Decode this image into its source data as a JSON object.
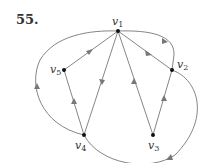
{
  "problem": {
    "number": "55."
  },
  "graph": {
    "type": "directed",
    "colors": {
      "edge": "#777777",
      "node": "#111111",
      "text": "#333333"
    },
    "vertices": [
      {
        "id": "v1",
        "label": "v",
        "sub": "1"
      },
      {
        "id": "v2",
        "label": "v",
        "sub": "2"
      },
      {
        "id": "v3",
        "label": "v",
        "sub": "3"
      },
      {
        "id": "v4",
        "label": "v",
        "sub": "4"
      },
      {
        "id": "v5",
        "label": "v",
        "sub": "5"
      }
    ],
    "edges": [
      {
        "from": "v5",
        "to": "v1",
        "shape": "straight"
      },
      {
        "from": "v1",
        "to": "v4",
        "shape": "straight"
      },
      {
        "from": "v3",
        "to": "v1",
        "shape": "straight"
      },
      {
        "from": "v1",
        "to": "v2",
        "shape": "straight"
      },
      {
        "from": "v3",
        "to": "v2",
        "shape": "straight"
      },
      {
        "from": "v4",
        "to": "v5",
        "shape": "straight"
      },
      {
        "from": "v4",
        "to": "v1",
        "shape": "curved-left"
      },
      {
        "from": "v1",
        "to": "v2",
        "shape": "curved-top-right"
      },
      {
        "from": "v2",
        "to": "v4",
        "shape": "curved-bottom-right"
      }
    ]
  }
}
